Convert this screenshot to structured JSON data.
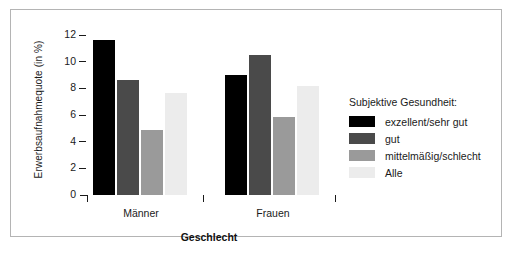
{
  "chart_data": {
    "type": "bar",
    "title": "",
    "xlabel": "Geschlecht",
    "ylabel": "Erwerbsaufnahmequote (in %)",
    "categories": [
      "Männer",
      "Frauen"
    ],
    "ylim": [
      0,
      12
    ],
    "yticks": [
      0,
      2,
      4,
      6,
      8,
      10,
      12
    ],
    "ytick_labels": [
      "0",
      "2",
      "4",
      "6",
      "8",
      "10",
      "12"
    ],
    "grid": false,
    "legend_position": "right",
    "legend_title": "Subjektive Gesundheit:",
    "series": [
      {
        "name": "exzellent/sehr gut",
        "color": "#000000",
        "values": [
          11.6,
          9.0
        ]
      },
      {
        "name": "gut",
        "color": "#4a4a4a",
        "values": [
          8.6,
          10.5
        ]
      },
      {
        "name": "mittelmäßig/schlecht",
        "color": "#9a9a9a",
        "values": [
          4.9,
          5.85
        ]
      },
      {
        "name": "Alle",
        "color": "#ececec",
        "values": [
          7.65,
          8.2
        ]
      }
    ]
  },
  "axes": {
    "y_title": "Erwerbsaufnahmequote (in %)",
    "x_title": "Geschlecht"
  },
  "legend": {
    "title": "Subjektive Gesundheit:",
    "items": [
      {
        "label": "exzellent/sehr gut",
        "color": "#000000"
      },
      {
        "label": "gut",
        "color": "#4a4a4a"
      },
      {
        "label": "mittelmäßig/schlecht",
        "color": "#9a9a9a"
      },
      {
        "label": "Alle",
        "color": "#ececec"
      }
    ]
  },
  "colors": {
    "frame_border": "#b4b4b4",
    "text": "#1a1a1a",
    "background": "#ffffff"
  }
}
